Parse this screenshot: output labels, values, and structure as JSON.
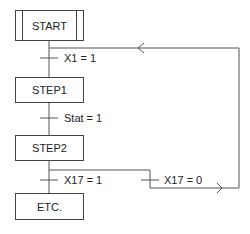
{
  "diagram": {
    "type": "grafcet",
    "steps": [
      {
        "id": "start",
        "label": "START",
        "initial": true
      },
      {
        "id": "step1",
        "label": "STEP1"
      },
      {
        "id": "step2",
        "label": "STEP2"
      },
      {
        "id": "etc",
        "label": "ETC."
      }
    ],
    "transitions": [
      {
        "id": "t1",
        "label": "X1 = 1",
        "from": "start",
        "to": "step1"
      },
      {
        "id": "t2",
        "label": "Stat = 1",
        "from": "step1",
        "to": "step2"
      },
      {
        "id": "t3",
        "label": "X17 = 1",
        "from": "step2",
        "to": "etc"
      },
      {
        "id": "t4",
        "label": "X17 = 0",
        "from": "step2",
        "to": "start"
      }
    ],
    "colors": {
      "line": "#444444",
      "text": "#222222",
      "background": "#ffffff"
    }
  }
}
